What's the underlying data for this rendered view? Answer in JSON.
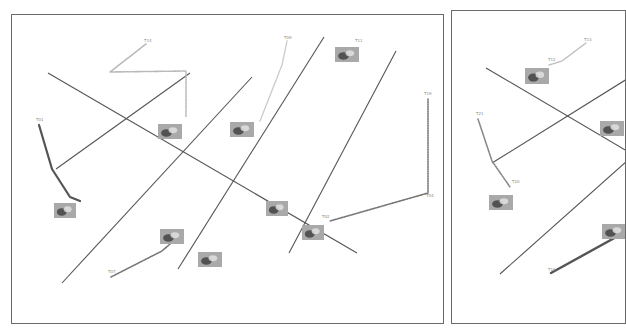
{
  "panels": [
    {
      "id": "left",
      "offset": [
        11,
        14
      ],
      "lines": [
        [
          36,
          58,
          345,
          238
        ],
        [
          44,
          154,
          178,
          58
        ],
        [
          50,
          268,
          240,
          62
        ],
        [
          166,
          254,
          312,
          22
        ],
        [
          277,
          238,
          384,
          36
        ]
      ],
      "trajectories": [
        {
          "label": "T01",
          "style": "solid",
          "color": "#555555",
          "width": 2.2,
          "points": [
            [
              27,
              110
            ],
            [
              40,
              154
            ],
            [
              58,
              182
            ],
            [
              68,
              186
            ]
          ]
        },
        {
          "label": "T14",
          "style": "dotted",
          "color": "#b8b8b8",
          "width": 1.6,
          "points": [
            [
              134,
              29
            ],
            [
              98,
              57
            ],
            [
              174,
              56
            ],
            [
              174,
              102
            ]
          ]
        },
        {
          "label": "T09",
          "style": "dotted",
          "color": "#c8c8c8",
          "width": 1.4,
          "points": [
            [
              275,
              26
            ],
            [
              270,
              50
            ],
            [
              248,
              106
            ]
          ]
        },
        {
          "label": "T07",
          "style": "dotted",
          "color": "#777777",
          "width": 1.6,
          "points": [
            [
              99,
              262
            ],
            [
              150,
              236
            ],
            [
              166,
              222
            ]
          ]
        },
        {
          "label": "T19",
          "style": "dotted",
          "color": "#777777",
          "width": 1.6,
          "points": [
            [
              416,
              84
            ],
            [
              416,
              178
            ],
            [
              318,
              206
            ]
          ]
        }
      ],
      "labels": [
        {
          "text": "T01",
          "x": 24,
          "y": 106
        },
        {
          "text": "T14",
          "x": 132,
          "y": 27
        },
        {
          "text": "T09",
          "x": 272,
          "y": 24
        },
        {
          "text": "T07",
          "x": 96,
          "y": 258
        },
        {
          "text": "T19",
          "x": 412,
          "y": 80
        },
        {
          "text": "T04",
          "x": 414,
          "y": 182
        },
        {
          "text": "T02",
          "x": 310,
          "y": 203
        },
        {
          "text": "T11",
          "x": 343,
          "y": 27
        }
      ],
      "thumbnails": [
        {
          "x": 42,
          "y": 188,
          "w": 22,
          "h": 15
        },
        {
          "x": 146,
          "y": 109,
          "w": 24,
          "h": 15
        },
        {
          "x": 218,
          "y": 107,
          "w": 24,
          "h": 15
        },
        {
          "x": 148,
          "y": 214,
          "w": 24,
          "h": 15
        },
        {
          "x": 186,
          "y": 237,
          "w": 24,
          "h": 15
        },
        {
          "x": 254,
          "y": 186,
          "w": 22,
          "h": 15
        },
        {
          "x": 290,
          "y": 210,
          "w": 22,
          "h": 15
        },
        {
          "x": 323,
          "y": 32,
          "w": 24,
          "h": 15
        }
      ]
    },
    {
      "id": "right",
      "offset": [
        451,
        10
      ],
      "lines": [
        [
          34,
          57,
          175,
          140
        ],
        [
          40,
          152,
          175,
          68
        ],
        [
          48,
          263,
          175,
          150
        ]
      ],
      "trajectories": [
        {
          "label": "T13",
          "style": "dotted",
          "color": "#bdbdbd",
          "width": 1.4,
          "points": [
            [
              134,
              32
            ],
            [
              110,
              50
            ],
            [
              97,
              54
            ]
          ]
        },
        {
          "label": "T21",
          "style": "dotted",
          "color": "#888888",
          "width": 1.6,
          "points": [
            [
              26,
              108
            ],
            [
              40,
              150
            ],
            [
              58,
              176
            ]
          ]
        },
        {
          "label": "T16",
          "style": "solid",
          "color": "#555555",
          "width": 2.4,
          "points": [
            [
              99,
              262
            ],
            [
              175,
              220
            ]
          ]
        }
      ],
      "labels": [
        {
          "text": "T13",
          "x": 132,
          "y": 30
        },
        {
          "text": "T12",
          "x": 96,
          "y": 50
        },
        {
          "text": "T21",
          "x": 24,
          "y": 104
        },
        {
          "text": "T20",
          "x": 60,
          "y": 172
        },
        {
          "text": "T16",
          "x": 96,
          "y": 260
        }
      ],
      "thumbnails": [
        {
          "x": 73,
          "y": 57,
          "w": 24,
          "h": 16
        },
        {
          "x": 37,
          "y": 184,
          "w": 24,
          "h": 15
        },
        {
          "x": 148,
          "y": 110,
          "w": 24,
          "h": 15
        },
        {
          "x": 150,
          "y": 213,
          "w": 24,
          "h": 15
        }
      ]
    }
  ],
  "colors": {
    "frame": "#6a6a6a",
    "line": "#555555",
    "thumb_fill": "#a9a9a9",
    "thumb_dark": "#3c3c3c"
  }
}
